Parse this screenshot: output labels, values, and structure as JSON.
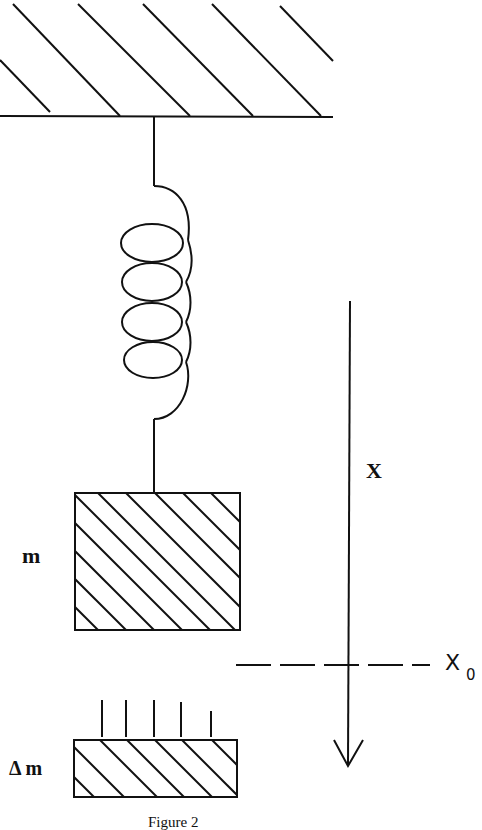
{
  "figure": {
    "caption": "Figure 2",
    "labels": {
      "mass": "m",
      "added_mass": "Δ m",
      "axis": "X",
      "equilibrium": "X",
      "equilibrium_subscript": "0"
    },
    "elements": {
      "ceiling": "hatched fixed support",
      "spring": "coil spring with 4 loops",
      "mass_block": "hatched block m",
      "added_mass_block": "hatched block Δm with falling lines above",
      "axis_arrow": "downward arrow X",
      "equilibrium_line": "dashed line X0"
    },
    "colors": {
      "ink": "#111111",
      "background": "#ffffff"
    }
  }
}
